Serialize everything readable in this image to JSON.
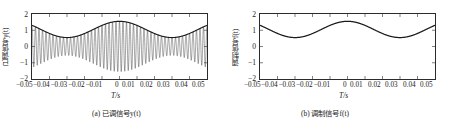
{
  "figure": {
    "panels": [
      {
        "id": "a",
        "caption": "(a) 已调信号y(t)",
        "ylabel": "已调信号y(t)",
        "xlabel": "T/s",
        "ytick_labels": [
          "2",
          "1",
          "0",
          "−1",
          "−2"
        ],
        "xtick_labels": [
          "−0.05",
          "−0.04",
          "−0.03",
          "−0.02",
          "−0.01",
          "0",
          "0.01",
          "0.02",
          "0.03",
          "0.04",
          "0.05"
        ]
      },
      {
        "id": "b",
        "caption": "(b) 调制信号f(t)",
        "ylabel": "调制信号f(t)",
        "xlabel": "T/s",
        "ytick_labels": [
          "2",
          "1",
          "0",
          "−1",
          "−2"
        ],
        "xtick_labels": [
          "−0.05",
          "−0.04",
          "−0.03",
          "−0.02",
          "−0.01",
          "0",
          "0.01",
          "0.02",
          "0.03",
          "0.04",
          "0.05"
        ]
      }
    ]
  },
  "colors": {
    "axis": "#2b2b2b",
    "curve": "#1a1a1a",
    "background": "#ffffff"
  },
  "chart_data": [
    {
      "type": "line",
      "panel": "a",
      "title": "(a) 已调信号y(t)",
      "xlabel": "T/s",
      "ylabel": "已调信号y(t)",
      "xlim": [
        -0.05,
        0.05
      ],
      "ylim": [
        -2,
        2
      ],
      "xticks": [
        -0.05,
        -0.04,
        -0.03,
        -0.02,
        -0.01,
        0,
        0.01,
        0.02,
        0.03,
        0.04,
        0.05
      ],
      "yticks": [
        2,
        1,
        0,
        -1,
        -2
      ],
      "grid": false,
      "legend": "none",
      "series": [
        {
          "name": "modulated signal y(t)",
          "description": "AM waveform: y(t) = (1.05 + 0.5*cos(2*pi*16.7*t)) * cos(2*pi*500*t)",
          "envelope_amplitude_dc": 1.05,
          "envelope_amplitude_ac": 0.5,
          "modulating_frequency_hz": 16.7,
          "carrier_frequency_hz": 500,
          "sampled_points": {
            "x": [
              -0.05,
              -0.045,
              -0.04,
              -0.035,
              -0.03,
              -0.025,
              -0.02,
              -0.015,
              -0.01,
              -0.005,
              0,
              0.005,
              0.01,
              0.015,
              0.02,
              0.025,
              0.03,
              0.035,
              0.04,
              0.045,
              0.05
            ],
            "envelope_upper": [
              1.22,
              0.95,
              0.73,
              0.58,
              0.55,
              0.65,
              0.85,
              1.13,
              1.36,
              1.52,
              1.55,
              1.52,
              1.36,
              1.13,
              0.85,
              0.65,
              0.55,
              0.58,
              0.73,
              0.95,
              1.22
            ]
          }
        },
        {
          "name": "envelope",
          "description": "upper envelope curve f(t) drawn over the carrier oscillations"
        }
      ]
    },
    {
      "type": "line",
      "panel": "b",
      "title": "(b) 调制信号f(t)",
      "xlabel": "T/s",
      "ylabel": "调制信号f(t)",
      "xlim": [
        -0.05,
        0.05
      ],
      "ylim": [
        -2,
        2
      ],
      "xticks": [
        -0.05,
        -0.04,
        -0.03,
        -0.02,
        -0.01,
        0,
        0.01,
        0.02,
        0.03,
        0.04,
        0.05
      ],
      "yticks": [
        2,
        1,
        0,
        -1,
        -2
      ],
      "grid": false,
      "legend": "none",
      "series": [
        {
          "name": "modulating signal f(t)",
          "description": "f(t) = 1.05 + 0.5*cos(2*pi*16.7*t)",
          "x": [
            -0.05,
            -0.045,
            -0.04,
            -0.035,
            -0.03,
            -0.025,
            -0.02,
            -0.015,
            -0.01,
            -0.005,
            0,
            0.005,
            0.01,
            0.015,
            0.02,
            0.025,
            0.03,
            0.035,
            0.04,
            0.045,
            0.05
          ],
          "y": [
            1.22,
            0.95,
            0.73,
            0.58,
            0.55,
            0.65,
            0.85,
            1.13,
            1.36,
            1.52,
            1.55,
            1.52,
            1.36,
            1.13,
            0.85,
            0.65,
            0.55,
            0.58,
            0.73,
            0.95,
            1.22
          ]
        }
      ]
    }
  ]
}
